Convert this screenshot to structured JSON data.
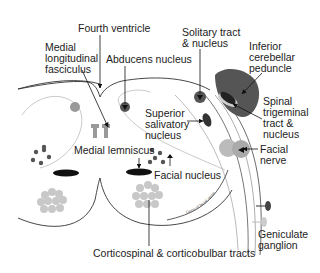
{
  "labels": {
    "fourth_ventricle": "Fourth ventricle",
    "mlf_1": "Medial",
    "mlf_2": "longitudinal",
    "mlf_3": "fasciculus",
    "abducens": "Abducens nucleus",
    "solitary_1": "Solitary tract",
    "solitary_2": "& nucleus",
    "icp_1": "Inferior",
    "icp_2": "cerebellar",
    "icp_3": "peduncle",
    "spinal_trig_1": "Spinal",
    "spinal_trig_2": "trigeminal",
    "spinal_trig_3": "tract &",
    "spinal_trig_4": "nucleus",
    "sup_sal_1": "Superior",
    "sup_sal_2": "salivatory",
    "sup_sal_3": "nucleus",
    "facial_nerve_1": "Facial",
    "facial_nerve_2": "nerve",
    "medial_lemniscus": "Medial lemniscus",
    "facial_nucleus": "Facial nucleus",
    "geniculate_1": "Geniculate",
    "geniculate_2": "ganglion",
    "corticospinal": "Corticospinal & corticobulbar tracts",
    "tiny_curve_text": "Genu of facial nerve"
  },
  "colors": {
    "outline": "#333333",
    "light_line": "#bbbbbb",
    "dark_gray": "#555555",
    "mid_gray": "#888888",
    "light_gray": "#c8c8c8",
    "black": "#111111"
  }
}
